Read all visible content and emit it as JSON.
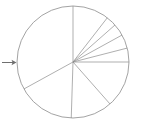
{
  "figure": {
    "background_color": "#ffffff",
    "outline_color": "#8c8c8c",
    "arrow_color": "#6f6f6f",
    "arrow_glyph": "→",
    "arrow_name": "right-arrow"
  },
  "chart_data": {
    "type": "pie",
    "title": "",
    "subtitle": "",
    "xlabel": "",
    "ylabel": "",
    "legend": [],
    "labels": [],
    "tick_labels": [],
    "annotations": [],
    "grid": false,
    "legend_position": "none",
    "filled": false,
    "center": {
      "x": 73,
      "y": 62
    },
    "radius": 56,
    "start_angle_deg": 90,
    "direction": "counterclockwise",
    "values": [
      33.0,
      16.5,
      12.0,
      13.5,
      4.0,
      4.0,
      3.5,
      3.0,
      10.5
    ],
    "categories": [
      "s1",
      "s2",
      "s3",
      "s4",
      "s5",
      "s6",
      "s7",
      "s8",
      "s9"
    ],
    "boundary_angles_deg": [
      90,
      208.8,
      268.2,
      311.4,
      360,
      374.4,
      388.8,
      401.4,
      412.2,
      450
    ],
    "series": [
      {
        "name": "slices",
        "values": [
          33.0,
          16.5,
          12.0,
          13.5,
          4.0,
          4.0,
          3.5,
          3.0,
          10.5
        ]
      }
    ]
  }
}
